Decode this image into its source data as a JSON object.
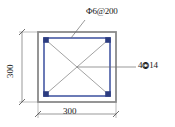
{
  "drawing": {
    "type": "reinforced-concrete-column-cross-section",
    "title": "",
    "labels": {
      "stirrup": "Φ6@200",
      "longitudinal_rebar_count": "4",
      "longitudinal_rebar_symbol": "⭗",
      "longitudinal_rebar_size": "14",
      "longitudinal_rebar_full": "4 ⭗14",
      "dimension_bottom": "300",
      "dimension_left": "300"
    },
    "colors": {
      "concrete_outline": "#8a8a8a",
      "stirrup": "#3b4f9e",
      "rebar_fill": "#2c3c80",
      "diagonal": "#4a4a4a",
      "dimension_line": "#6e6e6e",
      "leader_line": "#6e6e6e",
      "text": "#1a1a1a",
      "background": "#ffffff"
    },
    "geometry": {
      "section_width_mm": 300,
      "section_height_mm": 300,
      "rebar_count": 4,
      "rebar_diameter_mm": 14,
      "stirrup_diameter_mm": 6,
      "stirrup_spacing_mm": 200
    }
  }
}
